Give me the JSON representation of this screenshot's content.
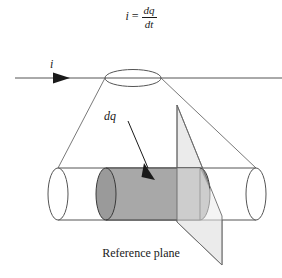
{
  "figure": {
    "equation": {
      "variable": "i",
      "equals": "=",
      "numerator": "dq",
      "denominator": "dt"
    },
    "current_label": "i",
    "charge_label": "dq",
    "caption": "Reference plane",
    "colors": {
      "stroke": "#555555",
      "dark_stroke": "#2b2b2b",
      "charge_fill": "#a8a8a8",
      "plane_fill": "#ebebeb",
      "background": "#ffffff",
      "text": "#1a1a1a"
    },
    "shapes": {
      "wire_line": "horizontal current line with arrowhead",
      "top_ellipse": "cross-section ellipse on wire",
      "cylinder": "conductor cylinder",
      "charge_slice": "shaded charge element dq",
      "reference_plane": "tilted reference plane parallelogram",
      "cone_left": "projection line left",
      "cone_right": "projection line right",
      "dq_pointer": "arrow from dq label to charge slice"
    }
  }
}
